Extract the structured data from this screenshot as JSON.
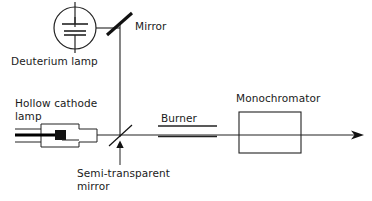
{
  "diagram": {
    "background_color": "#ffffff",
    "line_color": "#222222",
    "text_color": "#1a1a1a",
    "labels": {
      "mirror": "Mirror",
      "deuterium_lamp": "Deuterium lamp",
      "hollow_cathode_lamp_line1": "Hollow cathode",
      "hollow_cathode_lamp_line2": "lamp",
      "semi_transparent_mirror_line1": "Semi-transparent",
      "semi_transparent_mirror_line2": "mirror",
      "burner": "Burner",
      "monochromator": "Monochromator"
    },
    "components": [
      {
        "name": "deuterium-lamp",
        "label": "Deuterium lamp",
        "icon": "circle-with-capacitor-plates",
        "position": {
          "cx": 75,
          "cy": 27,
          "r": 21
        }
      },
      {
        "name": "mirror",
        "label": "Mirror",
        "icon": "thick-diagonal-line",
        "position": {
          "x1": 108,
          "y1": 33,
          "x2": 131,
          "y2": 14
        }
      },
      {
        "name": "hollow-cathode-lamp",
        "label": "Hollow cathode lamp",
        "icon": "stepped-tube-outline",
        "position": {
          "x": 41,
          "y": 124,
          "width": 56,
          "height": 23
        }
      },
      {
        "name": "semi-transparent-mirror",
        "label": "Semi-transparent mirror",
        "icon": "thin-diagonal-line",
        "position": {
          "x1": 109,
          "y1": 146,
          "x2": 131,
          "y2": 127
        }
      },
      {
        "name": "burner",
        "label": "Burner",
        "icon": "double-horizontal-bar",
        "position": {
          "x1": 158,
          "y1": 126,
          "x2": 217,
          "y2": 136
        }
      },
      {
        "name": "monochromator",
        "label": "Monochromator",
        "icon": "rectangle-box",
        "position": {
          "x": 239,
          "y": 112,
          "width": 62,
          "height": 41
        }
      },
      {
        "name": "output-beam-arrow",
        "label": "",
        "icon": "arrow-right",
        "position": {
          "x": 360,
          "y": 135
        }
      }
    ]
  }
}
